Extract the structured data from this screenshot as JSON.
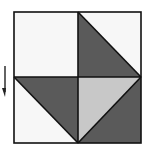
{
  "diagram": {
    "type": "quilt-square",
    "colors": {
      "white": "#f7f7f7",
      "dark": "#5a5a5a",
      "light": "#c8c8c8",
      "line": "#111111"
    },
    "pieces": [
      {
        "name": "top-left-square",
        "fill": "white"
      },
      {
        "name": "top-right-lower-left-triangle",
        "fill": "dark"
      },
      {
        "name": "top-right-upper-right-triangle",
        "fill": "white"
      },
      {
        "name": "bottom-left-upper-triangle",
        "fill": "dark"
      },
      {
        "name": "bottom-left-lower-triangle",
        "fill": "white"
      },
      {
        "name": "bottom-right-upper-left-triangle",
        "fill": "light"
      },
      {
        "name": "bottom-right-lower-right-triangle",
        "fill": "dark"
      }
    ],
    "arrow": {
      "direction": "down"
    }
  }
}
